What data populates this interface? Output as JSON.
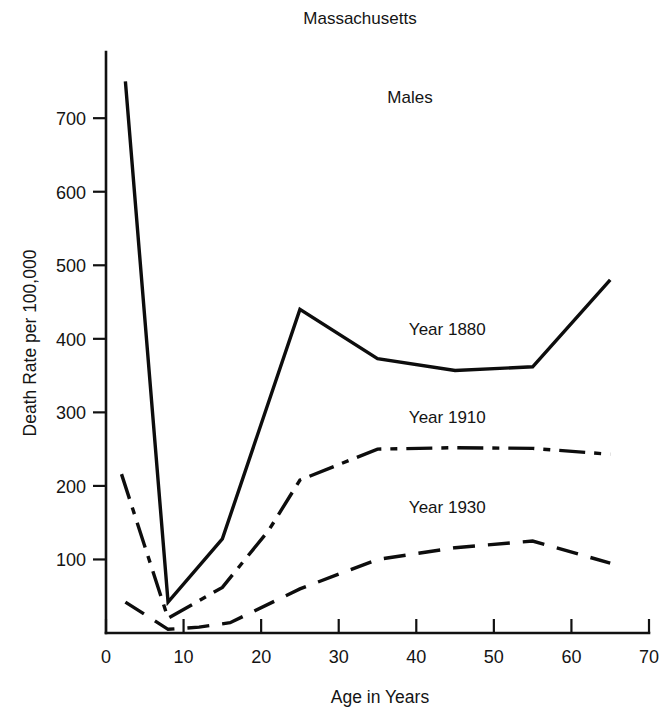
{
  "chart_data": {
    "type": "line",
    "title": "Massachusetts",
    "subtitle": "Males",
    "xlabel": "Age in Years",
    "ylabel": "Death Rate per 100,000",
    "xlim": [
      0,
      70
    ],
    "ylim": [
      0,
      790
    ],
    "xticks": [
      0,
      10,
      20,
      30,
      40,
      50,
      60,
      70
    ],
    "xticklabels": [
      "0",
      "10",
      "20",
      "30",
      "40",
      "50",
      "60",
      "70"
    ],
    "yticks": [
      100,
      200,
      300,
      400,
      500,
      600,
      700
    ],
    "yticklabels": [
      "100",
      "200",
      "300",
      "400",
      "500",
      "600",
      "700"
    ],
    "grid": false,
    "legend_position": "inline-right",
    "series": [
      {
        "name": "Year 1880",
        "linestyle": "solid",
        "color": "#0d0d0d",
        "label_x": 44,
        "label_y": 405,
        "x": [
          2.5,
          8,
          15,
          25,
          35,
          45,
          55,
          65
        ],
        "values": [
          750,
          42,
          128,
          440,
          373,
          357,
          362,
          480
        ]
      },
      {
        "name": "Year 1910",
        "linestyle": "dash-dot",
        "color": "#0d0d0d",
        "label_x": 44,
        "label_y": 285,
        "x": [
          2,
          8,
          15,
          21,
          25,
          35,
          45,
          55,
          65
        ],
        "values": [
          216,
          20,
          62,
          140,
          208,
          250,
          252,
          251,
          243
        ]
      },
      {
        "name": "Year 1930",
        "linestyle": "dashed",
        "color": "#0d0d0d",
        "label_x": 44,
        "label_y": 163,
        "x": [
          2.5,
          8,
          12,
          16,
          25,
          35,
          45,
          55,
          65
        ],
        "values": [
          42,
          5,
          8,
          14,
          60,
          100,
          116,
          125,
          95
        ]
      }
    ]
  }
}
